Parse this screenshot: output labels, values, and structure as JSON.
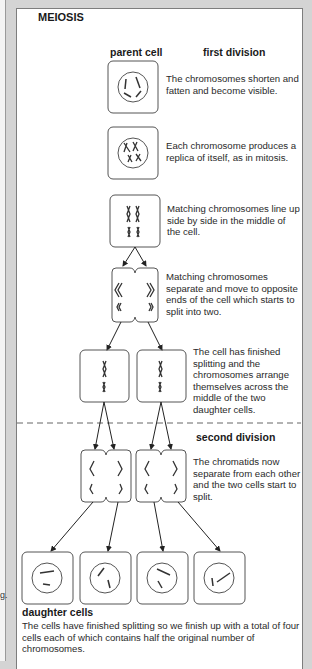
{
  "left_page": {
    "fragment": "g."
  },
  "title": "MEIOSIS",
  "headings": {
    "parent_cell": "parent cell",
    "first_division": "first division",
    "second_division": "second division",
    "daughter_cells": "daughter cells"
  },
  "stages": [
    {
      "id": "prophase",
      "text": "The chromosomes shorten and fatten and become visible."
    },
    {
      "id": "replication",
      "text": "Each chromosome produces a replica of itself, as in mitosis."
    },
    {
      "id": "metaphase-1",
      "text": "Matching chromosomes line up side by side in the middle of the cell."
    },
    {
      "id": "anaphase-1",
      "text": "Matching chromosomes separate and move to opposite ends of the cell which starts to split into two."
    },
    {
      "id": "metaphase-2",
      "text": "The cell has finished splitting and the chromosomes arrange themselves across the middle of the two daughter cells."
    },
    {
      "id": "anaphase-2",
      "text": "The chromatids now separate from each other and the two cells start to split."
    }
  ],
  "daughter_cells_text": "The cells have finished splitting so we finish up with a total of four cells each of which contains half the original number of chromosomes.",
  "colors": {
    "line": "#444444",
    "panel_border": "#7d7d7d",
    "background": "#d4d4d4"
  }
}
